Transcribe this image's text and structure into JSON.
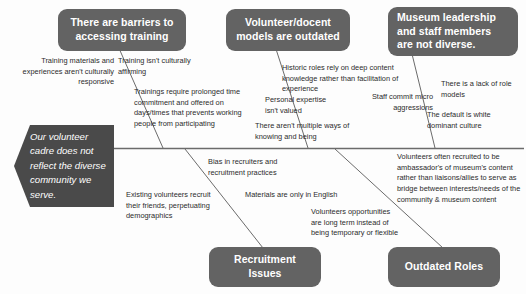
{
  "diagram": {
    "type": "fishbone-ishikawa",
    "effect": {
      "label": "Our volunteer cadre does not reflect the diverse community we serve."
    },
    "colors": {
      "box_fill": "#636363",
      "effect_fill": "#4a4a4a",
      "box_text": "#ffffff",
      "cause_text": "#2b2b2b",
      "line": "#6b6b6b",
      "background": "#fdfdfd"
    },
    "categories": [
      {
        "id": "barriers-to-training",
        "label": "There are barriers to accessing  training",
        "position": "top",
        "causes": [
          {
            "id": "training-materials",
            "text": "Training materials and experiences aren't culturally responsive"
          },
          {
            "id": "not-culturally-affirming",
            "text": "Training isn't culturally affirming"
          },
          {
            "id": "prolonged-time-commitment",
            "text": "Trainings require prolonged time commitment and offered on days/times that prevents working people from participating"
          }
        ]
      },
      {
        "id": "volunteer-docent-models",
        "label": "Volunteer/docent models are outdated",
        "position": "top",
        "causes": [
          {
            "id": "historic-roles",
            "text": "Historic roles rely on deep content knowledge rather than facilitation of experience"
          },
          {
            "id": "personal-expertise",
            "text": "Personal expertise isn't valued"
          },
          {
            "id": "ways-of-knowing",
            "text": "There aren't multiple ways of knowing and being"
          }
        ]
      },
      {
        "id": "leadership-not-diverse",
        "label": "Museum leadership and staff members are not diverse.",
        "position": "top",
        "causes": [
          {
            "id": "micro-aggressions",
            "text": "Staff commit micro aggressions"
          },
          {
            "id": "lack-of-role-models",
            "text": "There is a lack of role models"
          },
          {
            "id": "white-dominant-culture",
            "text": "The default is white dominant culture"
          }
        ]
      },
      {
        "id": "recruitment-issues",
        "label": "Recruitment Issues",
        "position": "bottom",
        "causes": [
          {
            "id": "bias-in-recruiters",
            "text": "Bias in recruiters and recruitment practices"
          },
          {
            "id": "existing-volunteers-recruit-friends",
            "text": "Existing volunteers recruit their friends, perpetuating demographics"
          },
          {
            "id": "materials-only-english",
            "text": "Materials are only in English"
          }
        ]
      },
      {
        "id": "outdated-roles",
        "label": "Outdated Roles",
        "position": "bottom",
        "causes": [
          {
            "id": "ambassadors-not-liaisons",
            "text": "Volunteers often recruited to be ambassador's of museum's content rather than liaisons/allies to serve as bridge between interests/needs of the community & museum content"
          },
          {
            "id": "long-term-opportunities",
            "text": "Volunteers opportunities are long term instead of being temporary or flexible"
          }
        ]
      }
    ]
  }
}
